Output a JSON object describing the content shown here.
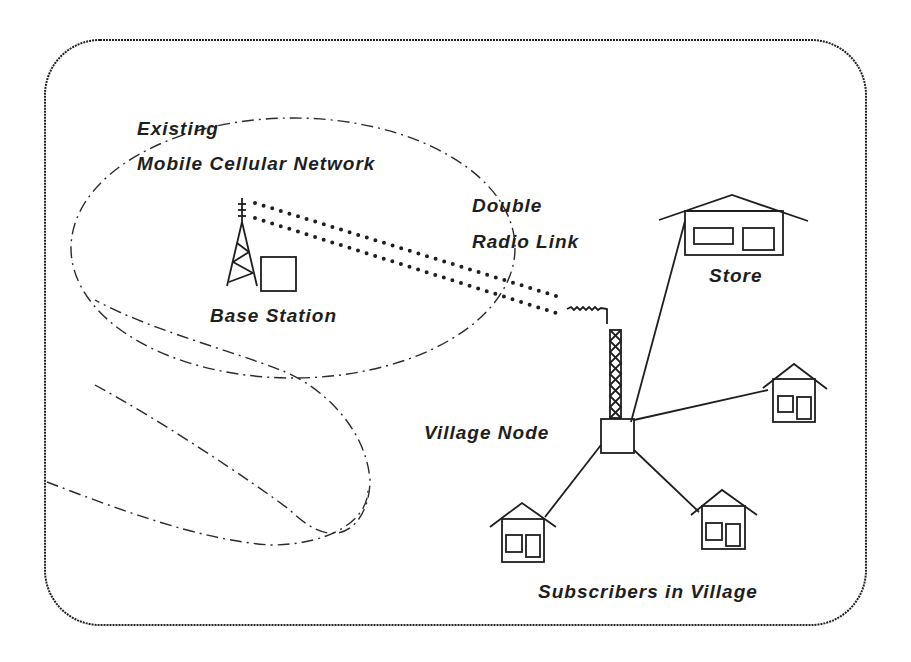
{
  "diagram": {
    "labels": {
      "network_line1": "Existing",
      "network_line2": "Mobile Cellular Network",
      "base_station": "Base Station",
      "radio_link_line1": "Double",
      "radio_link_line2": "Radio Link",
      "store": "Store",
      "village_node": "Village Node",
      "subscribers": "Subscribers in Village"
    },
    "nodes": [
      {
        "id": "base-station",
        "type": "tower-with-equipment-box"
      },
      {
        "id": "village-node",
        "type": "lattice-mast-with-antenna-and-box"
      },
      {
        "id": "store",
        "type": "building"
      },
      {
        "id": "house-right",
        "type": "house"
      },
      {
        "id": "house-bottom-left",
        "type": "house"
      },
      {
        "id": "house-bottom-right",
        "type": "house"
      }
    ],
    "edges": [
      {
        "from": "base-station",
        "to": "village-node",
        "style": "double dotted radio link"
      },
      {
        "from": "village-node",
        "to": "store",
        "style": "solid line"
      },
      {
        "from": "village-node",
        "to": "house-right",
        "style": "solid line"
      },
      {
        "from": "village-node",
        "to": "house-bottom-left",
        "style": "solid line"
      },
      {
        "from": "village-node",
        "to": "house-bottom-right",
        "style": "solid line"
      }
    ],
    "regions": [
      {
        "id": "coverage-area-main",
        "style": "dash-dot ellipse"
      },
      {
        "id": "coverage-area-lobe",
        "style": "dash-dot lobe"
      }
    ],
    "colors": {
      "ink": "#1e1e1e",
      "background": "#ffffff"
    }
  }
}
